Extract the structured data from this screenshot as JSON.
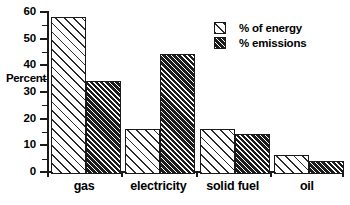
{
  "chart_data": {
    "type": "bar",
    "title": "",
    "xlabel": "",
    "ylabel": "Percent",
    "ylim": [
      0,
      60
    ],
    "ytick_step": 10,
    "yticks": [
      0,
      10,
      20,
      30,
      40,
      50,
      60
    ],
    "ytick_labels": [
      "0",
      "10",
      "20",
      "30",
      "40",
      "50",
      "60"
    ],
    "minor_tick_step": 5,
    "grid": false,
    "legend_position": "top-right",
    "categories": [
      "gas",
      "electricity",
      "solid  fuel",
      "oil"
    ],
    "series": [
      {
        "name": "% of energy",
        "fill": "white-diagonal-hatch",
        "values": [
          59,
          17,
          17,
          7
        ]
      },
      {
        "name": "% emissions",
        "fill": "dark-diagonal-hatch",
        "values": [
          35,
          45,
          15,
          5
        ]
      }
    ],
    "colors": {
      "axis": "#1a1a1a",
      "background": "#ffffff",
      "series_light_fill": "#ffffff",
      "series_light_hatch": "#2b2b2b",
      "series_dark_fill": "#1c1c1c",
      "series_dark_hatch": "#ffffff"
    }
  }
}
